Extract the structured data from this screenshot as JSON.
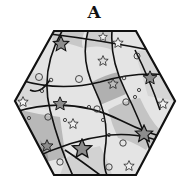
{
  "figure": {
    "label": "A",
    "shape": "hexagon",
    "colors": {
      "light": "#e6e6e6",
      "mid": "#cfcfcf",
      "dark": "#a9a9a9",
      "outline": "#111111",
      "star_dark": "#8c8c8c",
      "star_light": "#f0f0f0"
    },
    "elements": {
      "stars": 13,
      "circles": 19
    }
  }
}
